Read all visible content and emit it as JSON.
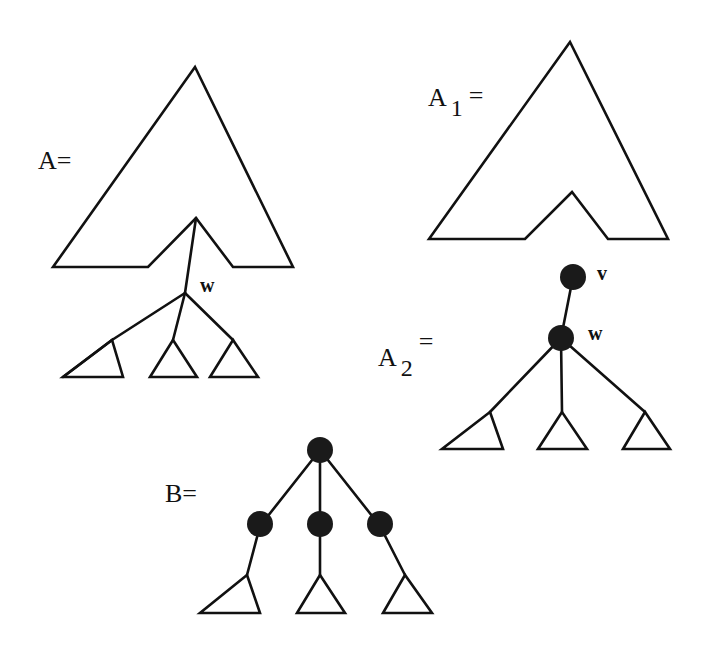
{
  "diagram": {
    "figures": {
      "A": {
        "label": "A=",
        "node_label_w": "w",
        "description": "Large tree-shape A with subtree rooted at w hanging below notch, w has three child subtrees"
      },
      "A1": {
        "label_base": "A",
        "label_sub": "1",
        "label_eq": "=",
        "description": "Tree-shape A with notch, subtree at w removed"
      },
      "A2": {
        "label_base": "A",
        "label_sub": "2",
        "label_eq": "=",
        "node_label_v": "v",
        "node_label_w": "w",
        "description": "Node v with child w, w has three child subtrees"
      },
      "B": {
        "label": "B=",
        "description": "Root node with three child nodes, each with a subtree"
      }
    }
  }
}
